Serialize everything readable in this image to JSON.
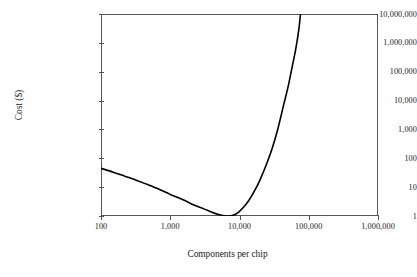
{
  "chart_data": {
    "type": "line",
    "title": "",
    "xlabel": "Components per chip",
    "ylabel": "Cost ($)",
    "xscale": "log",
    "yscale": "log",
    "xlim": [
      100,
      1000000
    ],
    "ylim": [
      1,
      10000000
    ],
    "grid": false,
    "legend": "none",
    "x_tick_labels": [
      "100",
      "1,000",
      "10,000",
      "100,000",
      "1,000,000"
    ],
    "x_tick_values": [
      100,
      1000,
      10000,
      100000,
      1000000
    ],
    "y_tick_labels": [
      "1",
      "10",
      "100",
      "1,000",
      "10,000",
      "100,000",
      "1,000,000",
      "10,000,000"
    ],
    "y_tick_values": [
      1,
      10,
      100,
      1000,
      10000,
      100000,
      1000000,
      10000000
    ],
    "series": [
      {
        "name": "Cost per component",
        "color": "#000000",
        "x": [
          100,
          150,
          220,
          330,
          480,
          700,
          1000,
          1500,
          2200,
          3000,
          4000,
          5000,
          6000,
          7000,
          8000,
          9000,
          10000,
          12000,
          14000,
          17000,
          20000,
          25000,
          30000,
          36000,
          43000,
          50000,
          58000,
          65000,
          72000,
          76000
        ],
        "y": [
          45,
          33,
          24,
          17,
          12,
          8.3,
          5.6,
          3.7,
          2.4,
          1.8,
          1.35,
          1.12,
          1.02,
          1.0,
          1.05,
          1.2,
          1.45,
          2.3,
          3.8,
          8.5,
          19,
          70,
          240,
          1100,
          6500,
          28000,
          160000,
          620000,
          3000000,
          10000000
        ]
      }
    ]
  },
  "axes": {
    "y_title": "Cost ($)",
    "x_title": "Components per chip"
  }
}
